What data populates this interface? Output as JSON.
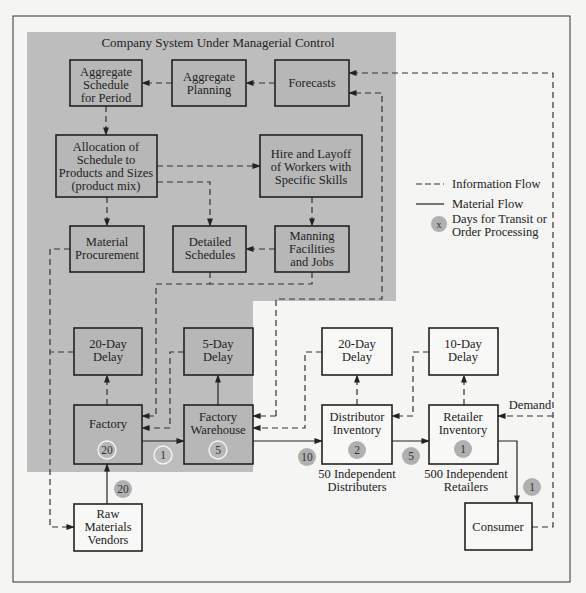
{
  "title": "Company System Under Managerial Control",
  "boxes": {
    "aggregate_schedule": [
      "Aggregate",
      "Schedule",
      "for Period"
    ],
    "aggregate_planning": [
      "Aggregate",
      "Planning"
    ],
    "forecasts": [
      "Forecasts"
    ],
    "allocation": [
      "Allocation of",
      "Schedule to",
      "Products and Sizes",
      "(product mix)"
    ],
    "hire_layoff": [
      "Hire and Layoff",
      "of Workers with",
      "Specific Skills"
    ],
    "material_procurement": [
      "Material",
      "Procurement"
    ],
    "detailed_schedules": [
      "Detailed",
      "Schedules"
    ],
    "manning": [
      "Manning",
      "Facilities",
      "and Jobs"
    ],
    "factory_delay": [
      "20-Day",
      "Delay"
    ],
    "warehouse_delay": [
      "5-Day",
      "Delay"
    ],
    "factory": [
      "Factory"
    ],
    "factory_warehouse": [
      "Factory",
      "Warehouse"
    ],
    "distributor_delay": [
      "20-Day",
      "Delay"
    ],
    "retailer_delay": [
      "10-Day",
      "Delay"
    ],
    "distributor_inventory": [
      "Distributor",
      "Inventory"
    ],
    "retailer_inventory": [
      "Retailer",
      "Inventory"
    ],
    "raw_materials": [
      "Raw",
      "Materials",
      "Vendors"
    ],
    "consumer": [
      "Consumer"
    ]
  },
  "captions": {
    "distributors": [
      "50 Independent",
      "Distributers"
    ],
    "retailers": [
      "500 Independent",
      "Retailers"
    ],
    "demand": "Demand"
  },
  "days": {
    "factory": "20",
    "factory_to_warehouse": "1",
    "warehouse": "5",
    "warehouse_to_distributor": "10",
    "distributor": "2",
    "distributor_to_retailer": "5",
    "retailer": "1",
    "retailer_to_consumer": "1",
    "vendors_to_factory": "20"
  },
  "legend": {
    "information_flow": "Information Flow",
    "material_flow": "Material Flow",
    "marker_symbol": "x",
    "days_label": [
      "Days for Transit or",
      "Order Processing"
    ]
  },
  "colors": {
    "managed_region": "#bdbdbd",
    "box_fill_managed": "#b7b7b7",
    "box_fill_external": "#f8f8f6",
    "day_marker": "#b0b0b0",
    "background": "#f5f5f3"
  }
}
